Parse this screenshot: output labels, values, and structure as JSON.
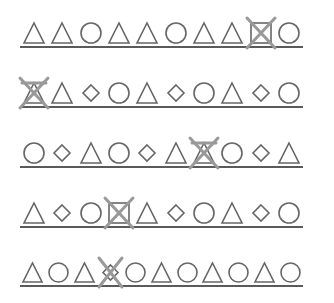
{
  "worksheet": {
    "outline_color": "#666666",
    "cross_color": "#999999",
    "rule_color": "#5a5a5a",
    "rows": [
      {
        "shapes": [
          "triangle",
          "triangle",
          "circle",
          "triangle",
          "triangle",
          "circle",
          "triangle",
          "triangle",
          "square",
          "circle"
        ],
        "crossed_index": 8
      },
      {
        "shapes": [
          "triangle",
          "triangle",
          "diamond",
          "circle",
          "triangle",
          "diamond",
          "circle",
          "triangle",
          "diamond",
          "circle"
        ],
        "crossed_index": 0
      },
      {
        "shapes": [
          "circle",
          "diamond",
          "triangle",
          "circle",
          "diamond",
          "triangle",
          "triangle",
          "circle",
          "diamond",
          "triangle"
        ],
        "crossed_index": 6
      },
      {
        "shapes": [
          "triangle",
          "diamond",
          "circle",
          "square",
          "triangle",
          "diamond",
          "circle",
          "triangle",
          "diamond",
          "circle"
        ],
        "crossed_index": 3
      },
      {
        "shapes": [
          "triangle",
          "circle",
          "triangle",
          "diamond",
          "circle",
          "triangle",
          "circle",
          "triangle",
          "circle",
          "triangle",
          "circle"
        ],
        "crossed_index": 3
      }
    ]
  }
}
